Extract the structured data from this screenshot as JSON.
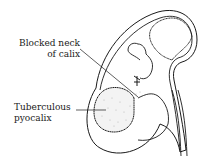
{
  "diagram": {
    "labels": {
      "blocked_neck_line1": "Blocked neck",
      "blocked_neck_line2": "of calix",
      "tb_line1": "Tuberculous",
      "tb_line2": "pyocalix"
    },
    "colors": {
      "stroke": "#1a1a1a",
      "background": "#ffffff",
      "stipple": "#b8b8b8"
    }
  }
}
